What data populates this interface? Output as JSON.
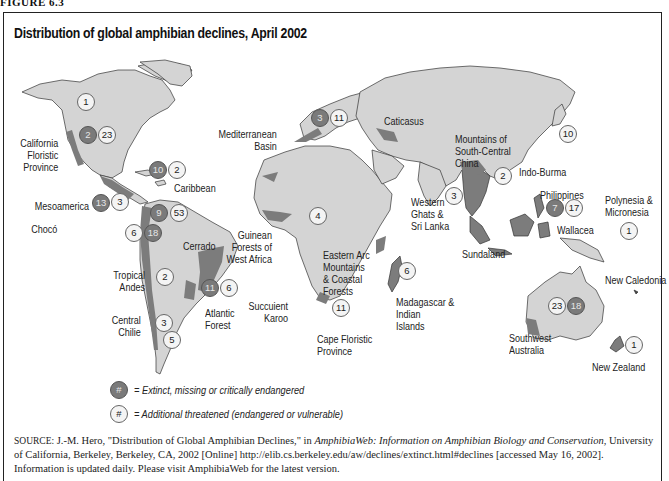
{
  "figure_label": "FIGURE 6.3",
  "title": "Distribution of global amphibian declines, April 2002",
  "colors": {
    "land": "#d4d4d4",
    "hotspot": "#7c7c7c",
    "extinct_badge": "#7a7a7a",
    "threatened_badge": "#f4f4f4",
    "frame": "#222222"
  },
  "regions": [
    {
      "name": "North America (unlabeled)",
      "threatened": "1"
    },
    {
      "name": "California Floristic Province",
      "label": "California\nFloristic\nProvince",
      "extinct": "2",
      "threatened": "23"
    },
    {
      "name": "Caribbean",
      "label": "Caribbean",
      "extinct": "10",
      "threatened": "2"
    },
    {
      "name": "Mesoamerica",
      "label": "Mesoamerica",
      "extinct": "13",
      "threatened": "3"
    },
    {
      "name": "Chocó",
      "label": "Chocó",
      "threatened": "6",
      "extinct": "18"
    },
    {
      "name": "Northern South America (Chocó/Andes)",
      "extinct": "9",
      "threatened": "53"
    },
    {
      "name": "Tropical Andes",
      "label": "Tropical\nAndes",
      "threatened": "2"
    },
    {
      "name": "Cerrado",
      "label": "Cerrado"
    },
    {
      "name": "Atlantic Forest",
      "label": "Atlantic\nForest",
      "extinct": "11",
      "threatened": "6"
    },
    {
      "name": "Central Chilie",
      "label": "Central\nChilie",
      "threatened": "3"
    },
    {
      "name": "Patagonia (unlabeled)",
      "threatened": "5"
    },
    {
      "name": "Mediterranean Basin",
      "label": "Mediterranean\nBasin",
      "extinct": "3",
      "threatened": "11"
    },
    {
      "name": "Caticasus",
      "label": "Caticasus"
    },
    {
      "name": "Guinean Forests of West Africa",
      "label": "Guinean\nForests of\nWest Africa",
      "threatened": "4"
    },
    {
      "name": "Eastern Arc Mountains & Coastal Forests",
      "label": "Eastern Arc\nMountains\n& Coastal\nForests"
    },
    {
      "name": "Succulent Karoo",
      "label": "Succuient\nKaroo",
      "threatened": "11"
    },
    {
      "name": "Cape Floristic Province",
      "label": "Cape Floristic\nProvince"
    },
    {
      "name": "Madagascar & Indian Islands",
      "label": "Madagascar &\nIndian\nIslands",
      "threatened": "6"
    },
    {
      "name": "Mountains of South-Central China",
      "label": "Mountains of\nSouth-Central\nChina"
    },
    {
      "name": "Indo-Burma",
      "label": "Indo-Burma",
      "threatened": "2"
    },
    {
      "name": "Japan (unlabeled)",
      "threatened": "10"
    },
    {
      "name": "Western Ghats & Sri Lanka",
      "label": "Western\nGhats &\nSri Lanka",
      "threatened": "3"
    },
    {
      "name": "Philippines",
      "label": "Philippines",
      "extinct": "7",
      "threatened": "17"
    },
    {
      "name": "Polynesia & Micronesia",
      "label": "Polynesia &\nMicronesia",
      "threatened": "1"
    },
    {
      "name": "Wallacea",
      "label": "Wallacea"
    },
    {
      "name": "Sundaland",
      "label": "Sundaland"
    },
    {
      "name": "Australia",
      "threatened": "23",
      "extinct": "18"
    },
    {
      "name": "Southwest Australia",
      "label": "Southwest\nAustralia"
    },
    {
      "name": "New Caledonia",
      "label": "New Caledonia"
    },
    {
      "name": "New Zealand",
      "label": "New Zealand",
      "threatened": "1"
    }
  ],
  "labels": {
    "california": [
      "California",
      "Floristic",
      "Province"
    ],
    "caribbean": "Caribbean",
    "mesoamerica": "Mesoamerica",
    "choco": "Chocó",
    "tropical_andes": [
      "Tropical",
      "Andes"
    ],
    "cerrado": "Cerrado",
    "atlantic_forest": [
      "Atlantic",
      "Forest"
    ],
    "central_chilie": [
      "Central",
      "Chilie"
    ],
    "mediterranean": [
      "Mediterranean",
      "Basin"
    ],
    "caticasus": "Caticasus",
    "guinean": [
      "Guinean",
      "Forests of",
      "West Africa"
    ],
    "eastern_arc": [
      "Eastern Arc",
      "Mountains",
      "& Coastal",
      "Forests"
    ],
    "succulent_karoo": [
      "Succuient",
      "Karoo"
    ],
    "cape_floristic": [
      "Cape Floristic",
      "Province"
    ],
    "madagascar": [
      "Madagascar &",
      "Indian",
      "Islands"
    ],
    "china": [
      "Mountains of",
      "South-Central",
      "China"
    ],
    "indo_burma": "Indo-Burma",
    "western_ghats": [
      "Western",
      "Ghats &",
      "Sri Lanka"
    ],
    "philippines": "Philippines",
    "polynesia": [
      "Polynesia &",
      "Micronesia"
    ],
    "wallacea": "Wallacea",
    "sundaland": "Sundaland",
    "southwest_australia": [
      "Southwest",
      "Australia"
    ],
    "new_caledonia": "New Caledonia",
    "new_zealand": "New Zealand"
  },
  "badges": {
    "na_1": "1",
    "ca_2": "2",
    "ca_23": "23",
    "car_10": "10",
    "car_2": "2",
    "meso_13": "13",
    "meso_3": "3",
    "nsa_9": "9",
    "nsa_53": "53",
    "choco_6": "6",
    "choco_18": "18",
    "andes_2": "2",
    "atl_11": "11",
    "atl_6": "6",
    "chile_3": "3",
    "pat_5": "5",
    "med_3": "3",
    "med_11": "11",
    "gui_4": "4",
    "karoo_11": "11",
    "mad_6": "6",
    "indo_2": "2",
    "jap_10": "10",
    "ghats_3": "3",
    "phil_7": "7",
    "phil_17": "17",
    "poly_1": "1",
    "aus_23": "23",
    "aus_18": "18",
    "nz_1": "1"
  },
  "legend": {
    "symbol": "#",
    "extinct": "= Extinct, missing or critically endangered",
    "threatened": "= Additional threatened (endangered or vulnerable)"
  },
  "source": {
    "prefix": "SOURCE:",
    "text1": " J.-M. Hero, \"Distribution of Global Amphibian Declines,\" in ",
    "italic1": "AmphibiaWeb: Information on Amphibian Biology and Conservation,",
    "text2": " University of California, Berkeley, Berkeley, CA, 2002 [Online] http://elib.cs.berkeley.edu/aw/declines/extinct.html#declines [accessed May 16, 2002]. Information is updated daily. Please visit AmphibiaWeb for the latest version."
  }
}
